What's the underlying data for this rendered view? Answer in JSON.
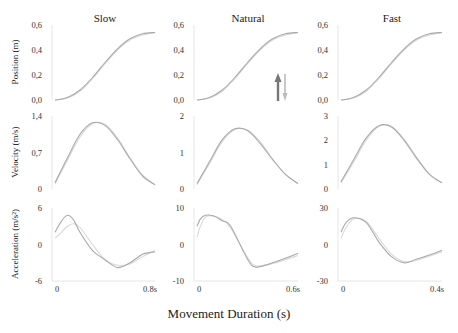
{
  "chart_data": {
    "type": "line",
    "title": "",
    "xlabel": "Movement Duration (s)",
    "grid": false,
    "columns": [
      {
        "title": "Slow",
        "duration": 0.8,
        "x_ticks": [
          "0",
          "0.8s"
        ]
      },
      {
        "title": "Natural",
        "duration": 0.6,
        "x_ticks": [
          "0",
          "0.6s"
        ]
      },
      {
        "title": "Fast",
        "duration": 0.4,
        "x_ticks": [
          "0",
          "0.4s"
        ]
      }
    ],
    "rows": [
      {
        "ylabel": "Position (m)",
        "quantity": "position"
      },
      {
        "ylabel": "Velocity (m/s)",
        "quantity": "velocity"
      },
      {
        "ylabel": "Acceleration (m/s²)",
        "quantity": "acceleration"
      }
    ],
    "panels": [
      {
        "row": 0,
        "col": 0,
        "ylim": [
          0,
          0.6
        ],
        "y_ticks": [
          "0,0",
          "0,2",
          "0,4",
          "0,6"
        ],
        "series": [
          {
            "name": "measured",
            "x": [
              0,
              0.1,
              0.2,
              0.3,
              0.4,
              0.5,
              0.6,
              0.7,
              0.8
            ],
            "y": [
              0.0,
              0.02,
              0.08,
              0.18,
              0.3,
              0.41,
              0.49,
              0.53,
              0.54
            ]
          },
          {
            "name": "model",
            "x": [
              0,
              0.1,
              0.2,
              0.3,
              0.4,
              0.5,
              0.6,
              0.7,
              0.8
            ],
            "y": [
              0.0,
              0.015,
              0.07,
              0.17,
              0.29,
              0.4,
              0.48,
              0.52,
              0.54
            ]
          }
        ]
      },
      {
        "row": 0,
        "col": 1,
        "ylim": [
          0,
          0.6
        ],
        "y_ticks": [
          "0,0",
          "0,2",
          "0,4",
          "0,6"
        ],
        "series": [
          {
            "name": "measured",
            "x": [
              0,
              0.075,
              0.15,
              0.225,
              0.3,
              0.375,
              0.45,
              0.525,
              0.6
            ],
            "y": [
              0.0,
              0.02,
              0.08,
              0.18,
              0.3,
              0.41,
              0.49,
              0.53,
              0.54
            ]
          },
          {
            "name": "model",
            "x": [
              0,
              0.075,
              0.15,
              0.225,
              0.3,
              0.375,
              0.45,
              0.525,
              0.6
            ],
            "y": [
              0.0,
              0.015,
              0.07,
              0.17,
              0.29,
              0.4,
              0.48,
              0.52,
              0.54
            ]
          }
        ]
      },
      {
        "row": 0,
        "col": 2,
        "ylim": [
          0,
          0.6
        ],
        "y_ticks": [
          "0,0",
          "0,2",
          "0,4",
          "0,6"
        ],
        "series": [
          {
            "name": "measured",
            "x": [
              0,
              0.05,
              0.1,
              0.15,
              0.2,
              0.25,
              0.3,
              0.35,
              0.4
            ],
            "y": [
              0.0,
              0.02,
              0.08,
              0.18,
              0.3,
              0.41,
              0.49,
              0.53,
              0.54
            ]
          },
          {
            "name": "model",
            "x": [
              0,
              0.05,
              0.1,
              0.15,
              0.2,
              0.25,
              0.3,
              0.35,
              0.4
            ],
            "y": [
              0.0,
              0.015,
              0.07,
              0.17,
              0.29,
              0.4,
              0.48,
              0.52,
              0.54
            ]
          }
        ]
      },
      {
        "row": 1,
        "col": 0,
        "ylim": [
          0,
          1.4
        ],
        "y_ticks": [
          "0",
          "0,7",
          "1,4"
        ],
        "series": [
          {
            "name": "measured",
            "x": [
              0,
              0.1,
              0.2,
              0.3,
              0.4,
              0.5,
              0.6,
              0.7,
              0.8
            ],
            "y": [
              0.12,
              0.6,
              1.05,
              1.27,
              1.22,
              0.95,
              0.58,
              0.25,
              0.08
            ]
          },
          {
            "name": "model",
            "x": [
              0,
              0.1,
              0.2,
              0.3,
              0.4,
              0.5,
              0.6,
              0.7,
              0.8
            ],
            "y": [
              0.1,
              0.55,
              1.0,
              1.25,
              1.24,
              0.98,
              0.6,
              0.27,
              0.08
            ]
          }
        ]
      },
      {
        "row": 1,
        "col": 1,
        "ylim": [
          0,
          2
        ],
        "y_ticks": [
          "0",
          "1",
          "2"
        ],
        "series": [
          {
            "name": "measured",
            "x": [
              0,
              0.075,
              0.15,
              0.225,
              0.3,
              0.375,
              0.45,
              0.525,
              0.6
            ],
            "y": [
              0.15,
              0.75,
              1.35,
              1.65,
              1.6,
              1.25,
              0.8,
              0.4,
              0.15
            ]
          },
          {
            "name": "model",
            "x": [
              0,
              0.075,
              0.15,
              0.225,
              0.3,
              0.375,
              0.45,
              0.525,
              0.6
            ],
            "y": [
              0.12,
              0.7,
              1.3,
              1.63,
              1.62,
              1.3,
              0.82,
              0.4,
              0.14
            ]
          }
        ]
      },
      {
        "row": 1,
        "col": 2,
        "ylim": [
          0,
          3
        ],
        "y_ticks": [
          "0",
          "1",
          "2",
          "3"
        ],
        "series": [
          {
            "name": "measured",
            "x": [
              0,
              0.05,
              0.1,
              0.15,
              0.2,
              0.25,
              0.3,
              0.35,
              0.4
            ],
            "y": [
              0.3,
              1.2,
              2.1,
              2.6,
              2.55,
              2.0,
              1.25,
              0.6,
              0.25
            ]
          },
          {
            "name": "model",
            "x": [
              0,
              0.05,
              0.1,
              0.15,
              0.2,
              0.25,
              0.3,
              0.35,
              0.4
            ],
            "y": [
              0.25,
              1.1,
              2.0,
              2.58,
              2.58,
              2.05,
              1.3,
              0.62,
              0.25
            ]
          }
        ]
      },
      {
        "row": 2,
        "col": 0,
        "ylim": [
          -6,
          6
        ],
        "y_ticks": [
          "-6",
          "0",
          "6"
        ],
        "series": [
          {
            "name": "measured",
            "x": [
              0,
              0.05,
              0.1,
              0.15,
              0.2,
              0.3,
              0.4,
              0.5,
              0.6,
              0.7,
              0.8
            ],
            "y": [
              2.0,
              3.8,
              4.8,
              4.0,
              2.0,
              -1.0,
              -2.5,
              -3.8,
              -3.0,
              -1.6,
              -1.2
            ]
          },
          {
            "name": "model",
            "x": [
              0,
              0.05,
              0.1,
              0.15,
              0.2,
              0.3,
              0.4,
              0.5,
              0.6,
              0.7,
              0.8
            ],
            "y": [
              1.0,
              2.0,
              3.0,
              3.4,
              2.8,
              0.0,
              -2.5,
              -3.4,
              -3.2,
              -2.0,
              -1.0
            ]
          }
        ]
      },
      {
        "row": 2,
        "col": 1,
        "ylim": [
          -10,
          10
        ],
        "y_ticks": [
          "-10",
          "0",
          "10"
        ],
        "series": [
          {
            "name": "measured",
            "x": [
              0,
              0.02,
              0.05,
              0.1,
              0.15,
              0.2,
              0.3,
              0.35,
              0.45,
              0.6
            ],
            "y": [
              5.0,
              7.0,
              8.0,
              7.8,
              6.5,
              5.0,
              -4.0,
              -6.2,
              -5.0,
              -2.5
            ]
          },
          {
            "name": "model",
            "x": [
              0,
              0.02,
              0.05,
              0.1,
              0.15,
              0.2,
              0.3,
              0.35,
              0.45,
              0.6
            ],
            "y": [
              2.0,
              5.0,
              7.5,
              7.8,
              6.8,
              4.5,
              -3.5,
              -5.8,
              -5.2,
              -3.0
            ]
          }
        ]
      },
      {
        "row": 2,
        "col": 2,
        "ylim": [
          -30,
          30
        ],
        "y_ticks": [
          "-30",
          "0",
          "30"
        ],
        "series": [
          {
            "name": "measured",
            "x": [
              0,
              0.02,
              0.05,
              0.1,
              0.15,
              0.2,
              0.25,
              0.3,
              0.4
            ],
            "y": [
              10.0,
              18.0,
              22.0,
              18.0,
              2.0,
              -10.0,
              -15.0,
              -12.0,
              -5.0
            ]
          },
          {
            "name": "model",
            "x": [
              0,
              0.02,
              0.05,
              0.1,
              0.15,
              0.2,
              0.25,
              0.3,
              0.4
            ],
            "y": [
              5.0,
              14.0,
              21.0,
              19.0,
              5.0,
              -8.0,
              -14.0,
              -13.0,
              -6.0
            ]
          }
        ]
      }
    ],
    "annotations": [
      {
        "type": "arrow",
        "panel": "Position/Natural",
        "direction": "up",
        "color": "#777777"
      },
      {
        "type": "arrow",
        "panel": "Position/Natural",
        "direction": "down",
        "color": "#bbbbbb"
      }
    ]
  },
  "colors": {
    "series_primary": "#a9a9a9",
    "series_secondary": "#d9d9d9",
    "axis": "#e6e6e6"
  }
}
